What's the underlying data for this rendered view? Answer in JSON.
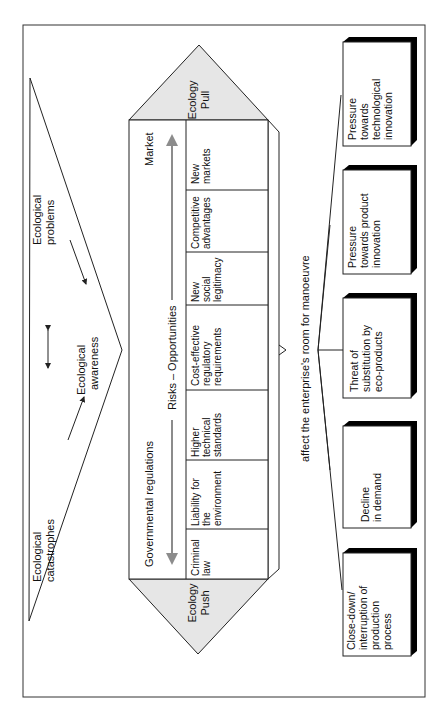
{
  "diagram": {
    "causes": {
      "catastrophes": [
        "Ecological",
        "catastrophes"
      ],
      "problems": [
        "Ecological",
        "problems"
      ],
      "awareness": [
        "Ecological",
        "awareness"
      ]
    },
    "house": {
      "pull_label": [
        "Ecology",
        "Pull"
      ],
      "push_label": [
        "Ecology",
        "Push"
      ],
      "market_label": "Market",
      "government_label": "Governmental regulations",
      "axis_label": "Risks – Opportunities",
      "cells": [
        {
          "lines": [
            "New",
            "markets"
          ]
        },
        {
          "lines": [
            "Competitive",
            "advantages"
          ]
        },
        {
          "lines": [
            "New",
            "social",
            "legitimacy"
          ]
        },
        {
          "lines": [
            "Cost-effective",
            "regulatory",
            "requirements"
          ]
        },
        {
          "lines": [
            "Higher",
            "technical",
            "standards"
          ]
        },
        {
          "lines": [
            "Liability for",
            "the",
            "environment"
          ]
        },
        {
          "lines": [
            "Criminal",
            "law"
          ]
        }
      ]
    },
    "effect_label": "affect the enterprise's room for manoeuvre",
    "outcomes": [
      {
        "lines": [
          "Pressure",
          "towards",
          "technological",
          "innovation"
        ]
      },
      {
        "lines": [
          "Pressure",
          "towards product",
          "innovation"
        ]
      },
      {
        "lines": [
          "Threat of",
          "substitution by",
          "eco-products"
        ]
      },
      {
        "lines": [
          "Decline",
          "in demand"
        ]
      },
      {
        "lines": [
          "Close-down/",
          "interruption of",
          "production",
          "process"
        ]
      }
    ],
    "colors": {
      "roof_fill": "#e6e6e6",
      "arrow_gray": "#8c8c8c",
      "line": "#222222"
    }
  }
}
